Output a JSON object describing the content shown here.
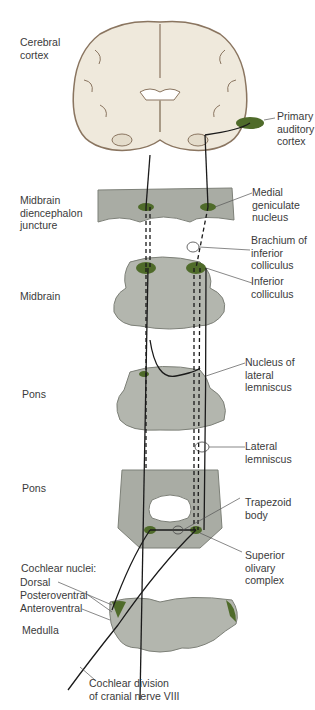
{
  "diagram": {
    "left_labels": {
      "cerebral_cortex": "Cerebral\ncortex",
      "midbrain_diencephalon": "Midbrain\ndiencephalon\njuncture",
      "midbrain": "Midbrain",
      "pons_upper": "Pons",
      "pons_lower": "Pons",
      "cochlear_nuclei": "Cochlear nuclei:",
      "dorsal": "Dorsal",
      "posteroventral": "Posteroventral",
      "anteroventral": "Anteroventral",
      "medulla": "Medulla",
      "cochlear_division": "Cochlear division\nof cranial nerve VIII"
    },
    "right_labels": {
      "primary_auditory_cortex": "Primary\nauditory\ncortex",
      "medial_geniculate": "Medial\ngeniculate\nnucleus",
      "brachium": "Brachium of\ninferior\ncolliculus",
      "inferior_colliculus": "Inferior\ncolliculus",
      "nucleus_lateral_lemniscus": "Nucleus of\nlateral\nlemniscus",
      "lateral_lemniscus": "Lateral\nlemniscus",
      "trapezoid_body": "Trapezoid\nbody",
      "superior_olivary": "Superior\nolivary\ncomplex"
    },
    "colors": {
      "nucleus_green": "#4f6b2a",
      "brain_tissue": "#efe9dc",
      "brain_outline": "#8a7560",
      "section_gray": "#a9aca4",
      "pathway": "#1a1a1a"
    }
  }
}
